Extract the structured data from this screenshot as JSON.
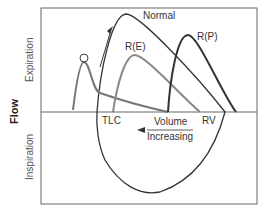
{
  "diagram": {
    "y_axis_label": "Flow",
    "upper_region_label": "Expiration",
    "lower_region_label": "Inspiration",
    "x_axis_annotation_line1": "Volume",
    "x_axis_annotation_line2": "Increasing",
    "marker_left": "TLC",
    "marker_right": "RV",
    "curves": [
      {
        "label": "Normal",
        "color": "#333333"
      },
      {
        "label": "O",
        "color": "#777777"
      },
      {
        "label": "R(E)",
        "color": "#888888"
      },
      {
        "label": "R(P)",
        "color": "#333333"
      }
    ]
  }
}
